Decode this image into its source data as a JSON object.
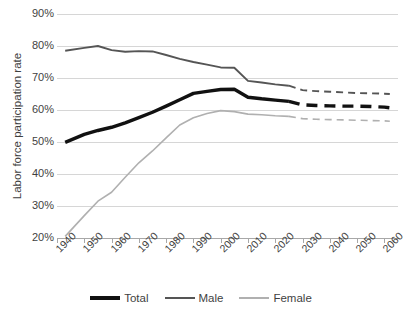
{
  "chart_data": {
    "type": "line",
    "title": "",
    "xlabel": "",
    "ylabel": "Labor force participation rate",
    "xlim": [
      1940,
      2065
    ],
    "ylim": [
      20,
      90
    ],
    "ytick_step": 10,
    "grid": true,
    "legend_position": "bottom",
    "x_tick_labels": [
      "1940",
      "1950",
      "1960",
      "1970",
      "1980",
      "1990",
      "2000",
      "2010",
      "2020",
      "2030",
      "2040",
      "2050",
      "2060"
    ],
    "y_tick_labels": [
      "90%",
      "80%",
      "70%",
      "60%",
      "50%",
      "40%",
      "30%",
      "20%"
    ],
    "y_tick_values": [
      90,
      80,
      70,
      60,
      50,
      40,
      30,
      20
    ],
    "note": "Solid segments are historical through about 2025; dashed segments are projections beyond 2025.",
    "projection_start_year": 2025,
    "series": [
      {
        "name": "Total",
        "color": "#111111",
        "width": 3.4,
        "style": "solid-then-dashed",
        "x": [
          1943,
          1950,
          1955,
          1960,
          1965,
          1970,
          1975,
          1980,
          1985,
          1990,
          1995,
          2000,
          2005,
          2010,
          2015,
          2020,
          2025
        ],
        "values": [
          49.9,
          52.4,
          53.6,
          54.6,
          56.0,
          57.6,
          59.3,
          61.2,
          63.2,
          65.2,
          65.8,
          66.4,
          66.5,
          64.0,
          63.5,
          63.1,
          62.7
        ],
        "projection_x": [
          2025,
          2030,
          2035,
          2040,
          2045,
          2050,
          2055,
          2060,
          2062
        ],
        "projection_values": [
          62.7,
          61.6,
          61.4,
          61.3,
          61.2,
          61.2,
          61.1,
          60.9,
          60.7
        ]
      },
      {
        "name": "Male",
        "color": "#555555",
        "width": 1.9,
        "style": "solid-then-dashed",
        "x": [
          1943,
          1950,
          1955,
          1960,
          1965,
          1970,
          1975,
          1980,
          1985,
          1990,
          1995,
          2000,
          2005,
          2010,
          2015,
          2020,
          2025
        ],
        "values": [
          78.5,
          79.4,
          80.0,
          78.7,
          78.2,
          78.4,
          78.3,
          77.2,
          76.0,
          75.0,
          74.2,
          73.3,
          73.2,
          69.1,
          68.6,
          68.0,
          67.6
        ],
        "projection_x": [
          2025,
          2030,
          2035,
          2040,
          2045,
          2050,
          2055,
          2060,
          2062
        ],
        "projection_values": [
          67.6,
          66.2,
          65.9,
          65.7,
          65.5,
          65.3,
          65.2,
          65.1,
          65.0
        ]
      },
      {
        "name": "Female",
        "color": "#b0b0b0",
        "width": 1.6,
        "style": "solid-then-dashed",
        "x": [
          1943,
          1950,
          1955,
          1960,
          1965,
          1970,
          1975,
          1980,
          1985,
          1990,
          1995,
          2000,
          2005,
          2010,
          2015,
          2020,
          2025
        ],
        "values": [
          20.5,
          27.0,
          31.5,
          34.3,
          39.0,
          43.5,
          47.2,
          51.3,
          55.3,
          57.6,
          58.9,
          59.8,
          59.5,
          58.7,
          58.5,
          58.2,
          58.0
        ],
        "projection_x": [
          2025,
          2030,
          2035,
          2040,
          2045,
          2050,
          2055,
          2060,
          2062
        ],
        "projection_values": [
          58.0,
          57.3,
          57.1,
          57.0,
          56.9,
          56.8,
          56.7,
          56.6,
          56.5
        ]
      }
    ]
  },
  "legend": {
    "entries": [
      {
        "label": "Total",
        "color": "#111111",
        "width": 4.4
      },
      {
        "label": "Male",
        "color": "#555555",
        "width": 2.6
      },
      {
        "label": "Female",
        "color": "#b0b0b0",
        "width": 1.8
      }
    ]
  }
}
